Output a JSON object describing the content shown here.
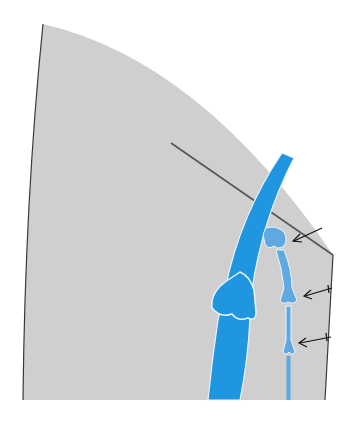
{
  "diagram": {
    "type": "anatomical-cross-section",
    "labels": [],
    "colors": {
      "background": "#ffffff",
      "tissue": "#cfcfcf",
      "outline": "#3a3a3a",
      "main_vessel": "#2196e0",
      "branch_vessel": "#5fa8e0",
      "highlight": "#e8f4ff",
      "reference_line": "#555555",
      "arrow": "#111111"
    },
    "elements": [
      {
        "name": "tissue-region",
        "shape": "curved-sector"
      },
      {
        "name": "reference-line",
        "from": [
          171,
          143
        ],
        "to": [
          333,
          255
        ]
      },
      {
        "name": "main-vessel",
        "shape": "curved-band-with-bulb"
      },
      {
        "name": "branch-vessel",
        "shape": "segmented-stem-with-bulbs",
        "segments": 3
      },
      {
        "name": "arrows",
        "count": 3
      }
    ]
  }
}
